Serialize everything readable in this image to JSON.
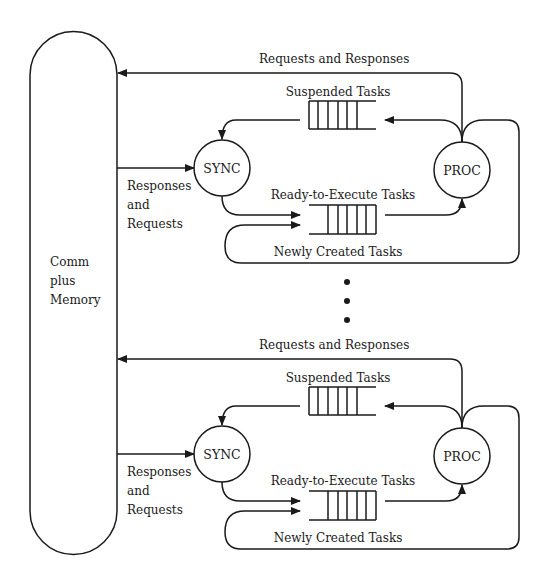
{
  "memory": {
    "label_lines": [
      "Comm",
      "plus",
      "Memory"
    ]
  },
  "processors": [
    {
      "sync_label": "SYNC",
      "proc_label": "PROC",
      "requests_and_responses": "Requests and Responses",
      "responses_and_requests_lines": [
        "Responses",
        "and",
        "Requests"
      ],
      "suspended_tasks": "Suspended Tasks",
      "ready_tasks": "Ready-to-Execute Tasks",
      "new_tasks": "Newly Created Tasks"
    },
    {
      "sync_label": "SYNC",
      "proc_label": "PROC",
      "requests_and_responses": "Requests and Responses",
      "responses_and_requests_lines": [
        "Responses",
        "and",
        "Requests"
      ],
      "suspended_tasks": "Suspended Tasks",
      "ready_tasks": "Ready-to-Execute Tasks",
      "new_tasks": "Newly Created Tasks"
    }
  ],
  "ellipsis": "⋮",
  "colors": {
    "line": "#1a1a1a",
    "background": "#ffffff"
  }
}
